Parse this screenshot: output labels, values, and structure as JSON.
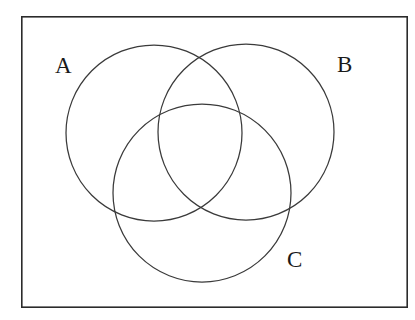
{
  "figure": {
    "type": "venn-diagram",
    "background_color": "#ffffff"
  },
  "frame": {
    "name": "universal-set-rectangle",
    "stroke_color": "#2b2b2b",
    "stroke_width": 1.6,
    "x": 21,
    "y": 16,
    "width": 387,
    "height": 292
  },
  "sets": [
    {
      "id": "A",
      "label": "A",
      "cx": 154,
      "cy": 133,
      "r": 88,
      "label_x": 55,
      "label_y": 54,
      "stroke_color": "#3a3a3a",
      "stroke_width": 1.25,
      "fill": "none"
    },
    {
      "id": "B",
      "label": "B",
      "cx": 246,
      "cy": 132,
      "r": 88,
      "label_x": 337,
      "label_y": 53,
      "stroke_color": "#3a3a3a",
      "stroke_width": 1.25,
      "fill": "none"
    },
    {
      "id": "C",
      "label": "C",
      "cx": 202,
      "cy": 193,
      "r": 89,
      "label_x": 287,
      "label_y": 248,
      "stroke_color": "#3a3a3a",
      "stroke_width": 1.25,
      "fill": "none"
    }
  ],
  "chart_data": {
    "type": "venn",
    "title": "",
    "xlabel": "",
    "ylabel": "",
    "grid": false,
    "legend": "none",
    "set_labels": [
      "A",
      "B",
      "C"
    ],
    "region_labels": [],
    "region_values": [],
    "shaded_regions": []
  }
}
